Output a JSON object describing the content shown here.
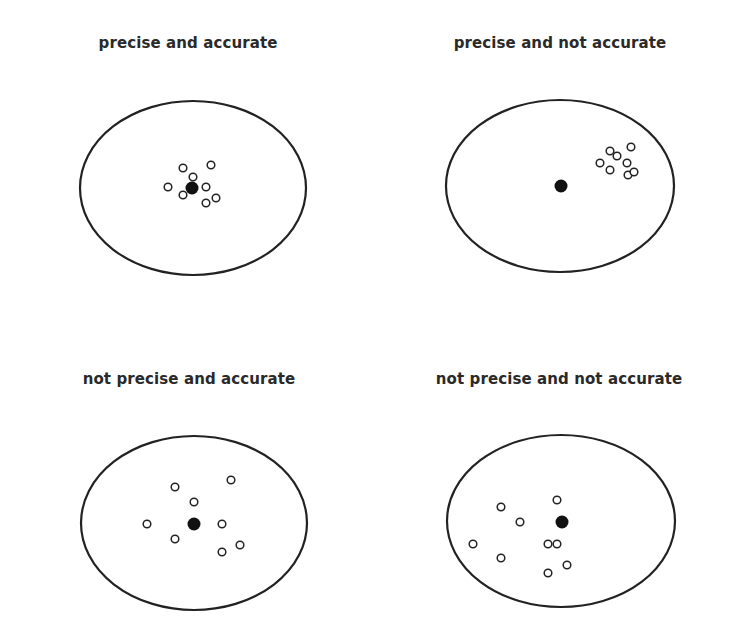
{
  "colors": {
    "background": "#ffffff",
    "stroke": "#222222",
    "text": "#2a2a2a"
  },
  "panels": [
    {
      "title": "precise and accurate",
      "title_pos": [
        188,
        44
      ],
      "target": {
        "cx": 193,
        "cy": 188,
        "rx": 113,
        "ry": 87
      },
      "center_dot": [
        192,
        188
      ],
      "shots": [
        [
          183,
          168
        ],
        [
          211,
          165
        ],
        [
          193,
          177
        ],
        [
          168,
          187
        ],
        [
          183,
          195
        ],
        [
          206,
          187
        ],
        [
          206,
          203
        ],
        [
          216,
          198
        ]
      ]
    },
    {
      "title": "precise and not accurate",
      "title_pos": [
        560,
        44
      ],
      "target": {
        "cx": 560,
        "cy": 186,
        "rx": 114,
        "ry": 86
      },
      "center_dot": [
        561,
        186
      ],
      "shots": [
        [
          610,
          151
        ],
        [
          617,
          156
        ],
        [
          631,
          147
        ],
        [
          600,
          163
        ],
        [
          610,
          170
        ],
        [
          627,
          163
        ],
        [
          628,
          175
        ],
        [
          634,
          172
        ]
      ]
    },
    {
      "title": "not precise and accurate",
      "title_pos": [
        189,
        380
      ],
      "target": {
        "cx": 194,
        "cy": 523,
        "rx": 113,
        "ry": 87
      },
      "center_dot": [
        194,
        524
      ],
      "shots": [
        [
          175,
          487
        ],
        [
          231,
          480
        ],
        [
          194,
          502
        ],
        [
          147,
          524
        ],
        [
          175,
          539
        ],
        [
          222,
          524
        ],
        [
          222,
          552
        ],
        [
          240,
          545
        ]
      ]
    },
    {
      "title": "not precise and not accurate",
      "title_pos": [
        559,
        380
      ],
      "target": {
        "cx": 561,
        "cy": 521,
        "rx": 114,
        "ry": 86
      },
      "center_dot": [
        562,
        522
      ],
      "shots": [
        [
          501,
          507
        ],
        [
          557,
          500
        ],
        [
          520,
          522
        ],
        [
          473,
          544
        ],
        [
          548,
          544
        ],
        [
          557,
          544
        ],
        [
          501,
          558
        ],
        [
          567,
          565
        ],
        [
          548,
          573
        ]
      ]
    }
  ]
}
